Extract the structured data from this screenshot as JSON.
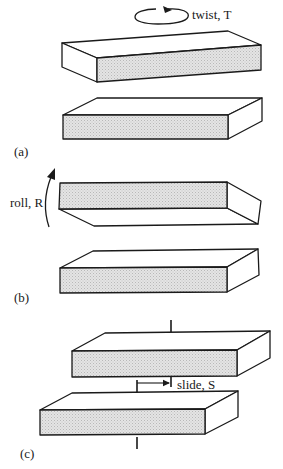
{
  "figure": {
    "panels": [
      {
        "id": "a",
        "label": "(a)",
        "motion_label": "twist, T",
        "motion": "twist"
      },
      {
        "id": "b",
        "label": "(b)",
        "motion_label": "roll, R",
        "motion": "roll"
      },
      {
        "id": "c",
        "label": "(c)",
        "motion_label": "slide, S",
        "motion": "slide"
      }
    ]
  },
  "colors": {
    "line": "#1a1a1a",
    "face_shaded": "#d9d9d9",
    "face_white": "#ffffff",
    "background": "#ffffff"
  }
}
